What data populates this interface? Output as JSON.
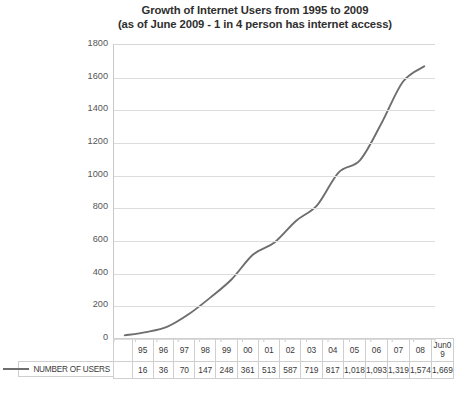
{
  "chart_data": {
    "type": "line",
    "title": "Growth of Internet Users from 1995 to 2009",
    "subtitle": "(as of June 2009 - 1 in 4 person has internet access)",
    "xlabel": "",
    "ylabel": "Million of Internet Users in the World",
    "categories": [
      "95",
      "96",
      "97",
      "98",
      "99",
      "00",
      "01",
      "02",
      "03",
      "04",
      "05",
      "06",
      "07",
      "08",
      "Jun09"
    ],
    "series": [
      {
        "name": "NUMBER OF USERS",
        "values": [
          16,
          36,
          70,
          147,
          248,
          361,
          513,
          587,
          719,
          817,
          1018,
          1093,
          1319,
          1574,
          1669
        ],
        "labels": [
          "16",
          "36",
          "70",
          "147",
          "248",
          "361",
          "513",
          "587",
          "719",
          "817",
          "1,018",
          "1,093",
          "1,319",
          "1,574",
          "1,669"
        ],
        "color": "#6e6e6e"
      }
    ],
    "ylim": [
      0,
      1800
    ],
    "ytick_labels": [
      "1800",
      "1600",
      "1400",
      "1200",
      "1000",
      "800",
      "600",
      "400",
      "200",
      "0"
    ],
    "ytick_values": [
      1800,
      1600,
      1400,
      1200,
      1000,
      800,
      600,
      400,
      200,
      0
    ],
    "grid": "horizontal",
    "legend_position": "bottom-left",
    "line_color": "#6e6e6e",
    "grid_color": "#dcdcdc"
  },
  "title": {
    "line1": "Growth of Internet Users from 1995 to 2009",
    "line2": "(as of June 2009 - 1 in 4 person has internet access)"
  },
  "axis": {
    "y_title": "Million of Internet Users in the World"
  },
  "legend": {
    "series_label": "NUMBER OF USERS"
  },
  "table": {
    "header_blank": "",
    "row_label_blank": "",
    "jun09_line1": "Jun0",
    "jun09_line2": "9"
  }
}
